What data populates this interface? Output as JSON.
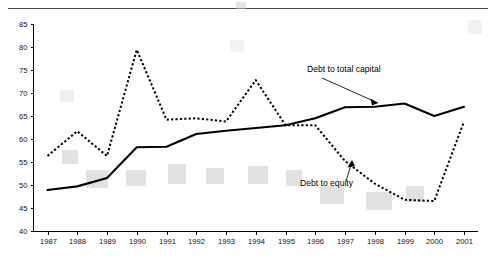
{
  "chart_data": {
    "type": "line",
    "title": "",
    "subtitle": "",
    "xlabel": "",
    "ylabel": "",
    "categories": [
      "1987",
      "1988",
      "1989",
      "1990",
      "1991",
      "1992",
      "1993",
      "1994",
      "1995",
      "1996",
      "1997",
      "1998",
      "1999",
      "2000",
      "2001"
    ],
    "x": [
      1987,
      1988,
      1989,
      1990,
      1991,
      1992,
      1993,
      1994,
      1995,
      1996,
      1997,
      1998,
      1999,
      2000,
      2001
    ],
    "ylim": [
      40,
      85
    ],
    "yticks": [
      40,
      45,
      50,
      55,
      60,
      65,
      70,
      75,
      80,
      85
    ],
    "ytick_labels": [
      "40",
      "45",
      "50",
      "55",
      "60",
      "65",
      "70",
      "75",
      "80",
      "85"
    ],
    "xtick_labels": [
      "1987",
      "1988",
      "1989",
      "1990",
      "1991",
      "1992",
      "1993",
      "1994",
      "1995",
      "1996",
      "1997",
      "1998",
      "1999",
      "2000",
      "2001"
    ],
    "grid": false,
    "legend_position": "inline-annotations",
    "series": [
      {
        "name": "Debt to total capital",
        "style": "solid",
        "color": "#000000",
        "values": [
          48.9,
          49.7,
          51.5,
          58.2,
          58.3,
          61.1,
          61.8,
          62.4,
          63.0,
          64.5,
          66.9,
          67.0,
          67.7,
          65.0,
          67.0
        ]
      },
      {
        "name": "Debt to equity",
        "style": "dashed",
        "color": "#000000",
        "values": [
          56.3,
          61.7,
          56.3,
          79.4,
          64.2,
          64.5,
          63.8,
          72.8,
          63.0,
          63.0,
          55.2,
          50.3,
          46.8,
          46.5,
          63.8
        ]
      }
    ],
    "annotations": [
      {
        "text": "Debt to total capital",
        "points_to_series": "Debt to total capital",
        "points_to_x": 1997
      },
      {
        "text": "Debt to equity",
        "points_to_series": "Debt to equity",
        "points_to_x": 1997
      }
    ]
  }
}
